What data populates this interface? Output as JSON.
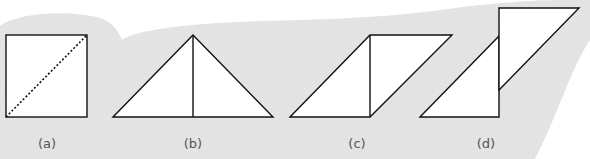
{
  "figure": {
    "panels": [
      {
        "id": "a",
        "label": "(a)",
        "description": "square with dashed diagonal"
      },
      {
        "id": "b",
        "label": "(b)",
        "description": "two right triangles forming isosceles triangle"
      },
      {
        "id": "c",
        "label": "(c)",
        "description": "two right triangles forming parallelogram"
      },
      {
        "id": "d",
        "label": "(d)",
        "description": "two right triangles offset vertically"
      }
    ],
    "colors": {
      "background_blob": "#e6e6e6",
      "shape_fill": "#ffffff",
      "stroke": "#111111",
      "label": "#555555"
    }
  }
}
